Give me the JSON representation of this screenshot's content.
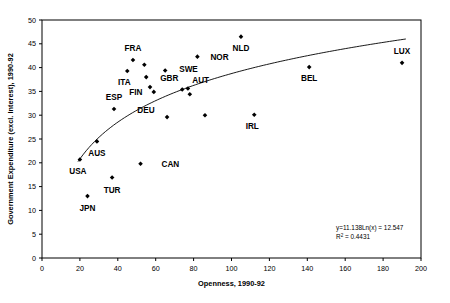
{
  "chart_data": {
    "type": "scatter",
    "title": "",
    "xlabel": "Openness, 1990-92",
    "ylabel": "Government Expenditure (excl. Interest), 1990-92",
    "xlim": [
      0,
      200
    ],
    "ylim": [
      0,
      50
    ],
    "xticks": [
      0,
      20,
      40,
      60,
      80,
      100,
      120,
      140,
      160,
      180,
      200
    ],
    "yticks": [
      0,
      5,
      10,
      15,
      20,
      25,
      30,
      35,
      40,
      45,
      50
    ],
    "grid": false,
    "legend": null,
    "marker": "diamond",
    "marker_color": "#000000",
    "points": [
      {
        "label": "USA",
        "x": 20,
        "y": 20.7,
        "label_dx": -2,
        "label_dy": 15
      },
      {
        "label": "JPN",
        "x": 24,
        "y": 13.0,
        "label_dx": 0,
        "label_dy": 15
      },
      {
        "label": "AUS",
        "x": 29,
        "y": 24.5,
        "label_dx": 0,
        "label_dy": 15
      },
      {
        "label": "TUR",
        "x": 37,
        "y": 16.9,
        "label_dx": 0,
        "label_dy": 15
      },
      {
        "label": "ESP",
        "x": 38,
        "y": 31.3,
        "label_dx": 0,
        "label_dy": -9
      },
      {
        "label": "ITA",
        "x": 45,
        "y": 39.3,
        "label_dx": -3,
        "label_dy": 14
      },
      {
        "label": "FRA",
        "x": 48,
        "y": 41.6,
        "label_dx": 0,
        "label_dy": -9
      },
      {
        "label": "CAN",
        "x": 52,
        "y": 19.8,
        "label_dx": 21,
        "label_dy": 3
      },
      {
        "label": "",
        "x": 54,
        "y": 40.6,
        "label_dx": 0,
        "label_dy": 0
      },
      {
        "label": "GBR",
        "x": 55,
        "y": 38.0,
        "label_dx": 14,
        "label_dy": 4
      },
      {
        "label": "DEU",
        "x": 57,
        "y": 35.9,
        "label_dx": -4,
        "label_dy": 26
      },
      {
        "label": "FIN",
        "x": 59,
        "y": 34.9,
        "label_dx": -18,
        "label_dy": 3
      },
      {
        "label": "SWE",
        "x": 65,
        "y": 39.4,
        "label_dx": 14,
        "label_dy": 2
      },
      {
        "label": "",
        "x": 66,
        "y": 29.6,
        "label_dx": 0,
        "label_dy": 0
      },
      {
        "label": "AUT",
        "x": 74,
        "y": 35.4,
        "label_dx": 10,
        "label_dy": -6
      },
      {
        "label": "",
        "x": 77,
        "y": 35.6,
        "label_dx": 0,
        "label_dy": 0
      },
      {
        "label": "",
        "x": 78,
        "y": 34.4,
        "label_dx": 0,
        "label_dy": 0
      },
      {
        "label": "NOR",
        "x": 82,
        "y": 42.3,
        "label_dx": 13,
        "label_dy": 3
      },
      {
        "label": "",
        "x": 86,
        "y": 30.0,
        "label_dx": 0,
        "label_dy": 0
      },
      {
        "label": "NLD",
        "x": 105,
        "y": 46.5,
        "label_dx": 0,
        "label_dy": 14
      },
      {
        "label": "IRL",
        "x": 112,
        "y": 30.1,
        "label_dx": -2,
        "label_dy": 14
      },
      {
        "label": "BEL",
        "x": 141,
        "y": 40.1,
        "label_dx": 0,
        "label_dy": 14
      },
      {
        "label": "LUX",
        "x": 190,
        "y": 41.0,
        "label_dx": 0,
        "label_dy": -9
      }
    ],
    "trendline": {
      "type": "logarithmic",
      "a": 11.138,
      "b": -12.547,
      "x_start": 19,
      "x_end": 192,
      "equation": "y=11.138Ln(x) = 12.547",
      "r2_label": "R",
      "r2_sup": "2",
      "r2_value": " = 0.4431"
    }
  }
}
